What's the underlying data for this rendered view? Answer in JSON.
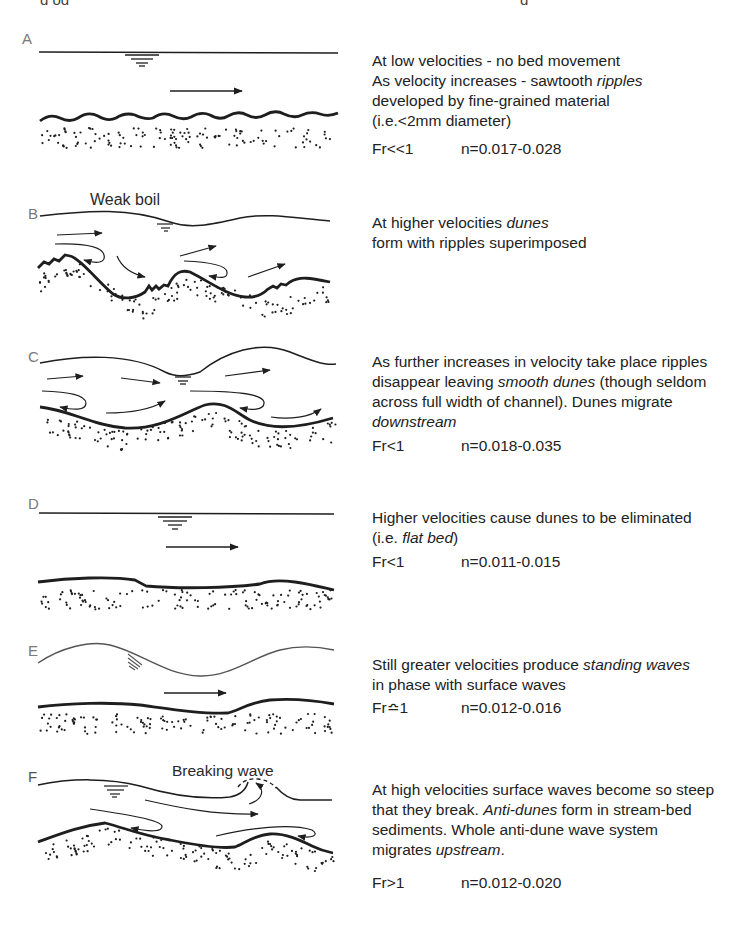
{
  "figure": {
    "panels": [
      {
        "id": "A",
        "label": "A",
        "callout": "",
        "description": [
          [
            {
              "t": "At low velocities - no bed movement"
            }
          ],
          [
            {
              "t": "As velocity increases - sawtooth "
            },
            {
              "t": "ripples",
              "i": true
            }
          ],
          [
            {
              "t": "developed by fine-grained material"
            }
          ],
          [
            {
              "t": "(i.e.<2mm diameter)"
            }
          ]
        ],
        "froude": "Fr<<1",
        "manning_n": "n=0.017-0.028"
      },
      {
        "id": "B",
        "label": "B",
        "callout": "Weak boil",
        "description": [
          [
            {
              "t": "At higher velocities "
            },
            {
              "t": "dunes",
              "i": true
            }
          ],
          [
            {
              "t": "form with ripples superimposed"
            }
          ]
        ],
        "froude": "",
        "manning_n": ""
      },
      {
        "id": "C",
        "label": "C",
        "callout": "",
        "description": [
          [
            {
              "t": "As further increases in velocity take place ripples"
            }
          ],
          [
            {
              "t": "disappear leaving "
            },
            {
              "t": "smooth dunes",
              "i": true
            },
            {
              "t": " (though seldom"
            }
          ],
          [
            {
              "t": "across full width of channel). Dunes migrate"
            }
          ],
          [
            {
              "t": "downstream",
              "i": true
            }
          ]
        ],
        "froude": "Fr<1",
        "manning_n": "n=0.018-0.035"
      },
      {
        "id": "D",
        "label": "D",
        "callout": "",
        "description": [
          [
            {
              "t": "Higher velocities cause dunes to be eliminated"
            }
          ],
          [
            {
              "t": "(i.e. "
            },
            {
              "t": "flat bed",
              "i": true
            },
            {
              "t": ")"
            }
          ]
        ],
        "froude": "Fr<1",
        "manning_n": "n=0.011-0.015"
      },
      {
        "id": "E",
        "label": "E",
        "callout": "",
        "description": [
          [
            {
              "t": "Still greater velocities produce "
            },
            {
              "t": "standing waves",
              "i": true
            }
          ],
          [
            {
              "t": "in phase with surface waves"
            }
          ]
        ],
        "froude": "Fr≏1",
        "manning_n": "n=0.012-0.016"
      },
      {
        "id": "F",
        "label": "F",
        "callout": "Breaking wave",
        "description": [
          [
            {
              "t": "At high velocities surface waves become so steep"
            }
          ],
          [
            {
              "t": "that they break. "
            },
            {
              "t": "Anti-dunes",
              "i": true
            },
            {
              "t": " form in stream-bed"
            }
          ],
          [
            {
              "t": "sediments.  Whole anti-dune wave system"
            }
          ],
          [
            {
              "t": "migrates "
            },
            {
              "t": "upstream",
              "i": true
            },
            {
              "t": "."
            }
          ]
        ],
        "froude": "Fr>1",
        "manning_n": "n=0.012-0.020"
      }
    ]
  },
  "header_cut": {
    "left": "g                 og",
    "right": "g"
  },
  "colors": {
    "ink": "#1e1e1e",
    "label_grey": "#7a7a7a",
    "paper": "#ffffff"
  }
}
